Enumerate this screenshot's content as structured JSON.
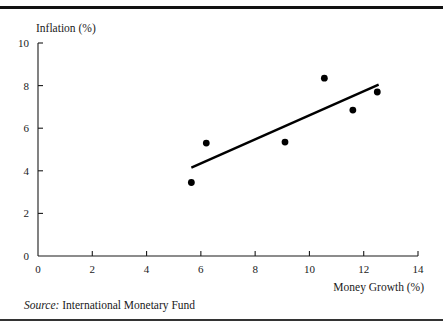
{
  "figure": {
    "y_axis_title": "Inflation (%)",
    "x_axis_title": "Money Growth (%)",
    "source_lead": "Source:",
    "source_text": "International Monetary Fund",
    "line_color": "#000000",
    "point_color": "#000000",
    "axis_color": "#1a1a1a",
    "background_color": "#ffffff"
  },
  "chart_data": {
    "type": "scatter",
    "title": "",
    "subtitle": "",
    "xlabel": "Money Growth (%)",
    "ylabel": "Inflation (%)",
    "xlim": [
      0,
      14
    ],
    "ylim": [
      0,
      10
    ],
    "xticks": [
      0,
      2,
      4,
      6,
      8,
      10,
      12,
      14
    ],
    "yticks": [
      0,
      2,
      4,
      6,
      8,
      10
    ],
    "xtick_labels": [
      "0",
      "2",
      "4",
      "6",
      "8",
      "10",
      "12",
      "14"
    ],
    "ytick_labels": [
      "0",
      "2",
      "4",
      "6",
      "8",
      "10"
    ],
    "grid": false,
    "legend": false,
    "legend_position": "none",
    "points": [
      {
        "x": 5.65,
        "y": 3.45
      },
      {
        "x": 6.2,
        "y": 5.3
      },
      {
        "x": 9.1,
        "y": 5.35
      },
      {
        "x": 10.55,
        "y": 8.35
      },
      {
        "x": 11.6,
        "y": 6.85
      },
      {
        "x": 12.5,
        "y": 7.7
      }
    ],
    "trendline": {
      "x0": 5.65,
      "y0": 4.15,
      "x1": 12.55,
      "y1": 8.05
    },
    "annotations": [
      {
        "text": "Source: International Monetary Fund",
        "position": "below-axis-left"
      }
    ]
  }
}
